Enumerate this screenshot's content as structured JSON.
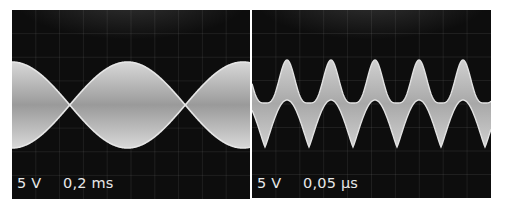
{
  "panels": [
    {
      "id": "left",
      "volts_per_div": "5 V",
      "time_per_div": "0,2 ms",
      "box": {
        "x": 12,
        "y": 10,
        "w": 238,
        "h": 189
      },
      "description": "Amplitude-modulated carrier (overmodulated / 100% modulation), filled envelope band"
    },
    {
      "id": "right",
      "volts_per_div": "5 V",
      "time_per_div": "0,05 µs",
      "box": {
        "x": 252,
        "y": 10,
        "w": 239,
        "h": 188
      },
      "description": "Superposition of two signals: periodic peaks with offset band"
    }
  ],
  "chart_data": [
    {
      "type": "area",
      "title": "Oscilloscope trace — AM signal envelope",
      "xlabel": "0,2 ms / div",
      "ylabel": "5 V / div",
      "grid": true,
      "grid_divisions": {
        "x": 10,
        "y": 8
      },
      "annotations": [
        "5 V",
        "0,2 ms"
      ],
      "series": [
        {
          "name": "upper envelope",
          "x_px": [
            12,
            45,
            78,
            105,
            133,
            160,
            188,
            215,
            243
          ],
          "y_px": [
            62,
            80,
            104,
            80,
            62,
            80,
            104,
            80,
            62
          ]
        },
        {
          "name": "lower envelope",
          "x_px": [
            12,
            45,
            78,
            105,
            133,
            160,
            188,
            215,
            243
          ],
          "y_px": [
            148,
            130,
            106,
            130,
            148,
            130,
            106,
            130,
            148
          ]
        }
      ],
      "envelope_period_px": 110,
      "envelope_max_x_px": [
        12,
        133,
        243
      ],
      "envelope_null_x_px": [
        78,
        188
      ]
    },
    {
      "type": "area",
      "title": "Oscilloscope trace — composite periodic signal",
      "xlabel": "0,05 µs / div",
      "ylabel": "5 V / div",
      "grid": true,
      "grid_divisions": {
        "x": 10,
        "y": 8
      },
      "annotations": [
        "5 V",
        "0,05 µs"
      ],
      "series": [
        {
          "name": "upper edge peaks",
          "x_px": [
            287,
            330,
            374,
            418,
            463
          ],
          "y_px": [
            60,
            60,
            60,
            60,
            60
          ]
        },
        {
          "name": "upper edge troughs",
          "x_px": [
            265,
            308,
            352,
            396,
            440,
            484
          ],
          "y_px": [
            103,
            102,
            102,
            102,
            102,
            103
          ]
        },
        {
          "name": "lower edge tops",
          "x_px": [
            287,
            330,
            374,
            418,
            463
          ],
          "y_px": [
            101,
            100,
            100,
            100,
            100
          ]
        },
        {
          "name": "lower edge bottoms",
          "x_px": [
            265,
            308,
            352,
            396,
            440,
            484
          ],
          "y_px": [
            147,
            147,
            147,
            147,
            147,
            147
          ]
        }
      ],
      "period_px": 44
    }
  ]
}
